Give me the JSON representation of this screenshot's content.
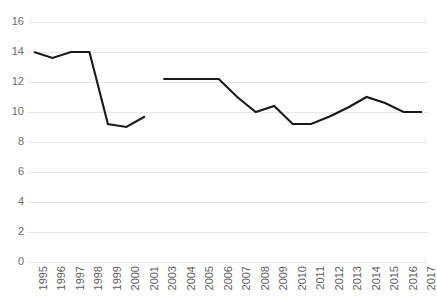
{
  "chart_data": {
    "type": "line",
    "title": "",
    "subtitle": "",
    "xlabel": "",
    "ylabel": "",
    "ylim": [
      0,
      16
    ],
    "ytick_step": 2,
    "yticks": [
      16,
      14,
      12,
      10,
      8,
      6,
      4,
      2,
      0
    ],
    "grid": "horizontal",
    "legend": "none",
    "line_color": "#1a1a1a",
    "gridline_color": "#e8e8e8",
    "tick_label_color": "#6d6d6d",
    "background_color": "#ffffff",
    "categories": [
      "1995",
      "1996",
      "1997",
      "1998",
      "1999",
      "2000",
      "2001",
      "2003",
      "2004",
      "2005",
      "2006",
      "2007",
      "2008",
      "2009",
      "2010",
      "2011",
      "2012",
      "2013",
      "2014",
      "2015",
      "2016",
      "2017"
    ],
    "note": "Series is drawn as two separate line segments; the year 2002 is absent from the category axis and the line is broken between 2001 and 2003.",
    "series": [
      {
        "name": "Series 1",
        "values": [
          14.0,
          13.6,
          14.0,
          14.0,
          9.2,
          9.0,
          9.7,
          null,
          12.2,
          12.2,
          12.2,
          11.0,
          10.0,
          10.4,
          9.2,
          9.2,
          9.7,
          10.3,
          11.0,
          10.6,
          10.0,
          10.0
        ]
      }
    ],
    "segments": [
      {
        "label": "1995-2001",
        "points": [
          {
            "x": "1995",
            "y": 14.0
          },
          {
            "x": "1996",
            "y": 13.6
          },
          {
            "x": "1997",
            "y": 14.0
          },
          {
            "x": "1998",
            "y": 14.0
          },
          {
            "x": "1999",
            "y": 9.2
          },
          {
            "x": "2000",
            "y": 9.0
          },
          {
            "x": "2001",
            "y": 9.7
          }
        ]
      },
      {
        "label": "2003-2017",
        "points": [
          {
            "x": "2003",
            "y": 12.2
          },
          {
            "x": "2004",
            "y": 12.2
          },
          {
            "x": "2005",
            "y": 12.2
          },
          {
            "x": "2006",
            "y": 12.2
          },
          {
            "x": "2007",
            "y": 11.0
          },
          {
            "x": "2008",
            "y": 10.0
          },
          {
            "x": "2009",
            "y": 10.4
          },
          {
            "x": "2010",
            "y": 9.2
          },
          {
            "x": "2011",
            "y": 9.2
          },
          {
            "x": "2012",
            "y": 9.7
          },
          {
            "x": "2013",
            "y": 10.3
          },
          {
            "x": "2014",
            "y": 11.0
          },
          {
            "x": "2015",
            "y": 10.6
          },
          {
            "x": "2016",
            "y": 10.0
          },
          {
            "x": "2017",
            "y": 10.0
          }
        ]
      }
    ]
  }
}
